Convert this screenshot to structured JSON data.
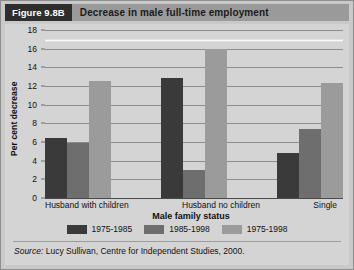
{
  "header": {
    "figure_badge": "Figure 9.8B",
    "title": "Decrease in male full-time employment"
  },
  "footer": {
    "source_prefix": "Source:",
    "source_text": "Lucy Sullivan, Centre for Independent Studies, 2000."
  },
  "colors": {
    "series_1975_1985": "#3a3a3a",
    "series_1985_1998": "#6e6e6e",
    "series_1975_1998": "#9b9b9b",
    "panel_background": "#d4d4d4",
    "frame_background": "#c9c9c9",
    "badge_background": "#2e2e2e",
    "title_background": "#9a9a9a",
    "gridline": "#8c8c8c"
  },
  "chart_data": {
    "type": "bar",
    "title": "Decrease in male full-time employment",
    "xlabel": "Male family status",
    "ylabel": "Per cent decrease",
    "categories": [
      "Husband with children",
      "Husband no children",
      "Single"
    ],
    "series": [
      {
        "name": "1975-1985",
        "values": [
          6.4,
          12.9,
          4.8
        ]
      },
      {
        "name": "1985-1998",
        "values": [
          5.9,
          3.0,
          7.4
        ]
      },
      {
        "name": "1975-1998",
        "values": [
          12.5,
          16.0,
          12.3
        ]
      }
    ],
    "ylim": [
      0,
      18
    ],
    "ytick_step": 2,
    "yticks": [
      18,
      16,
      14,
      12,
      10,
      8,
      6,
      4,
      2,
      0
    ],
    "grid": true,
    "legend_position": "bottom"
  }
}
